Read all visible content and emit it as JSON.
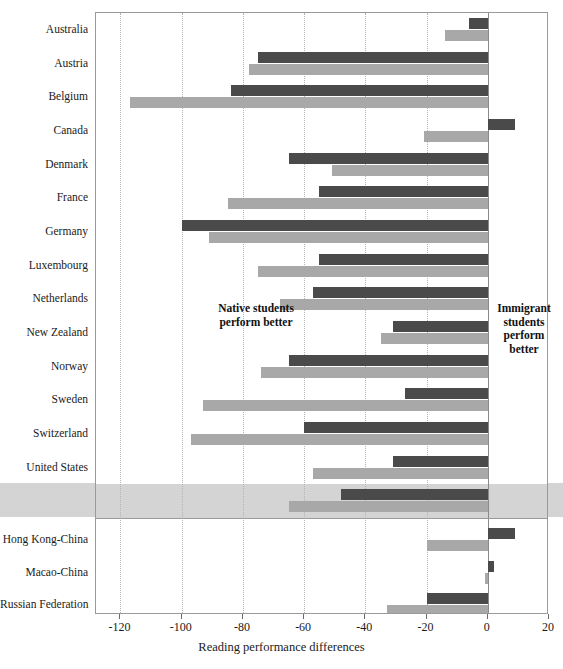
{
  "chart_data": {
    "type": "bar",
    "orientation": "horizontal",
    "title": "",
    "xlabel": "Reading performance differences",
    "ylabel": "",
    "xlim": [
      -128,
      20
    ],
    "xticks": [
      -120,
      -100,
      -80,
      -60,
      -40,
      -20,
      0,
      20
    ],
    "xtick_labels": [
      "-120",
      "-100",
      "-80",
      "-60",
      "-40",
      "-20",
      "0",
      "20"
    ],
    "grid": "vertical-dotted",
    "legend_position": "none",
    "series": [
      {
        "name": "first-generation students",
        "color": "#4a4a4a",
        "values": [
          -6,
          -75,
          -84,
          9,
          -65,
          -55,
          -100,
          -55,
          -57,
          -31,
          -65,
          -27,
          -60,
          -31,
          -48,
          9,
          2,
          -20
        ]
      },
      {
        "name": "second-generation students",
        "color": "#a8a8a8",
        "values": [
          -14,
          -78,
          -117,
          -21,
          -51,
          -85,
          -91,
          -75,
          -68,
          -35,
          -74,
          -93,
          -97,
          -57,
          -65,
          -20,
          -1,
          -33
        ]
      }
    ],
    "categories": [
      "Australia",
      "Austria",
      "Belgium",
      "Canada",
      "Denmark",
      "France",
      "Germany",
      "Luxembourg",
      "Netherlands",
      "New Zealand",
      "Norway",
      "Sweden",
      "Switzerland",
      "United States",
      "OECD average",
      "Hong Kong-China",
      "Macao-China",
      "Russian Federation"
    ],
    "highlighted_category": "OECD average",
    "partner_group_start_index": 15,
    "annotations": [
      {
        "name": "native-better",
        "text": "Native students\nperform better",
        "side": "left"
      },
      {
        "name": "immigrant-better",
        "text": "Immigrant students perform better",
        "side": "right"
      }
    ]
  },
  "annotations": {
    "native_line1": "Native students",
    "native_line2": "perform better",
    "immigrant_line1": "Immigrant",
    "immigrant_line2": "students",
    "immigrant_line3": "perform",
    "immigrant_line4": "better"
  },
  "axis": {
    "title": "Reading performance differences"
  }
}
